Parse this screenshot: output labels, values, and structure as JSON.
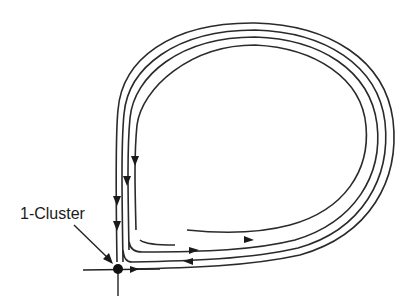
{
  "diagram": {
    "type": "phase-portrait",
    "labels": {
      "saddle_point": "1-Cluster"
    },
    "colors": {
      "line": "#2a2a2a",
      "background": "#ffffff"
    },
    "elements": {
      "fixed_point": {
        "name": "saddle point",
        "x": 118,
        "y": 269
      },
      "trajectory_count": 4,
      "arrow_count": 8
    }
  }
}
